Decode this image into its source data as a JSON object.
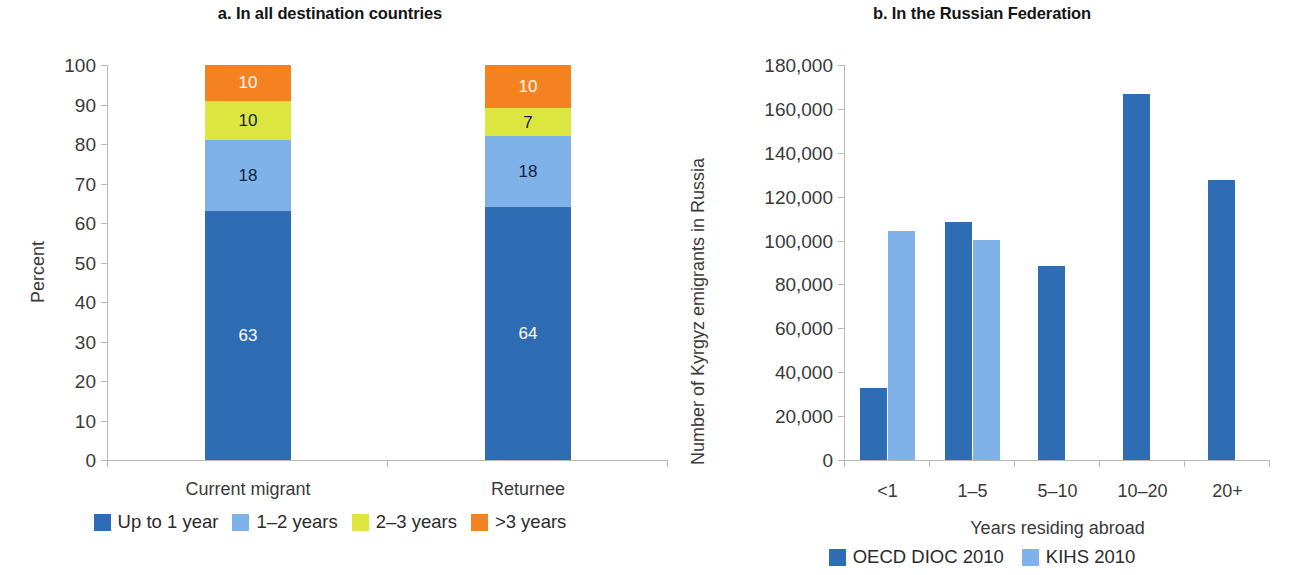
{
  "figure": {
    "panel_a": {
      "title": "a. In all destination countries",
      "ylabel": "Percent",
      "yticks": [
        "0",
        "10",
        "20",
        "30",
        "40",
        "50",
        "60",
        "70",
        "80",
        "90",
        "100"
      ],
      "xticklabels": [
        "Current migrant",
        "Returnee"
      ],
      "legend": [
        {
          "label": "Up to 1 year",
          "color": "#2E6DB4"
        },
        {
          "label": "1–2 years",
          "color": "#7FB2E8"
        },
        {
          "label": "2–3 years",
          "color": "#DDE53F"
        },
        {
          "label": ">3 years",
          "color": "#F58220"
        }
      ]
    },
    "panel_b": {
      "title": "b. In the Russian Federation",
      "ylabel": "Number of Kyrgyz emigrants in Russia",
      "xlabel": "Years residing abroad",
      "yticks": [
        "0",
        "20,000",
        "40,000",
        "60,000",
        "80,000",
        "100,000",
        "120,000",
        "140,000",
        "160,000",
        "180,000"
      ],
      "xticklabels": [
        "<1",
        "1–5",
        "5–10",
        "10–20",
        "20+"
      ],
      "legend": [
        {
          "label": "OECD DIOC 2010",
          "color": "#2E6DB4"
        },
        {
          "label": "KIHS 2010",
          "color": "#7FB2E8"
        }
      ]
    }
  },
  "chart_data": [
    {
      "type": "bar",
      "subtype": "stacked-100",
      "panel": "a",
      "title": "a. In all destination countries",
      "xlabel": "",
      "ylabel": "Percent",
      "ylim": [
        0,
        100
      ],
      "ytick_step": 10,
      "grid": false,
      "legend_position": "bottom",
      "categories": [
        "Current migrant",
        "Returnee"
      ],
      "series": [
        {
          "name": "Up to 1 year",
          "color": "#2E6DB4",
          "values": [
            63,
            64
          ],
          "labels": [
            "63",
            "64"
          ],
          "label_color": "#ffffff"
        },
        {
          "name": "1–2 years",
          "color": "#7FB2E8",
          "values": [
            18,
            18
          ],
          "labels": [
            "18",
            "18"
          ],
          "label_color": "#12233f"
        },
        {
          "name": "2–3 years",
          "color": "#DDE53F",
          "values": [
            10,
            7
          ],
          "labels": [
            "10",
            "7"
          ],
          "label_color": "#12233f"
        },
        {
          "name": ">3 years",
          "color": "#F58220",
          "values": [
            9,
            11
          ],
          "labels": [
            "10",
            "10"
          ],
          "label_color": "#ffffff"
        }
      ]
    },
    {
      "type": "bar",
      "subtype": "grouped",
      "panel": "b",
      "title": "b. In the Russian Federation",
      "xlabel": "Years residing abroad",
      "ylabel": "Number of Kyrgyz emigrants in Russia",
      "ylim": [
        0,
        180000
      ],
      "ytick_step": 20000,
      "grid": false,
      "legend_position": "bottom",
      "categories": [
        "<1",
        "1–5",
        "5–10",
        "10–20",
        "20+"
      ],
      "series": [
        {
          "name": "OECD DIOC 2010",
          "color": "#2E6DB4",
          "values": [
            33000,
            108500,
            88500,
            167000,
            127500
          ]
        },
        {
          "name": "KIHS 2010",
          "color": "#7FB2E8",
          "values": [
            104500,
            100500,
            null,
            null,
            null
          ]
        }
      ]
    }
  ]
}
